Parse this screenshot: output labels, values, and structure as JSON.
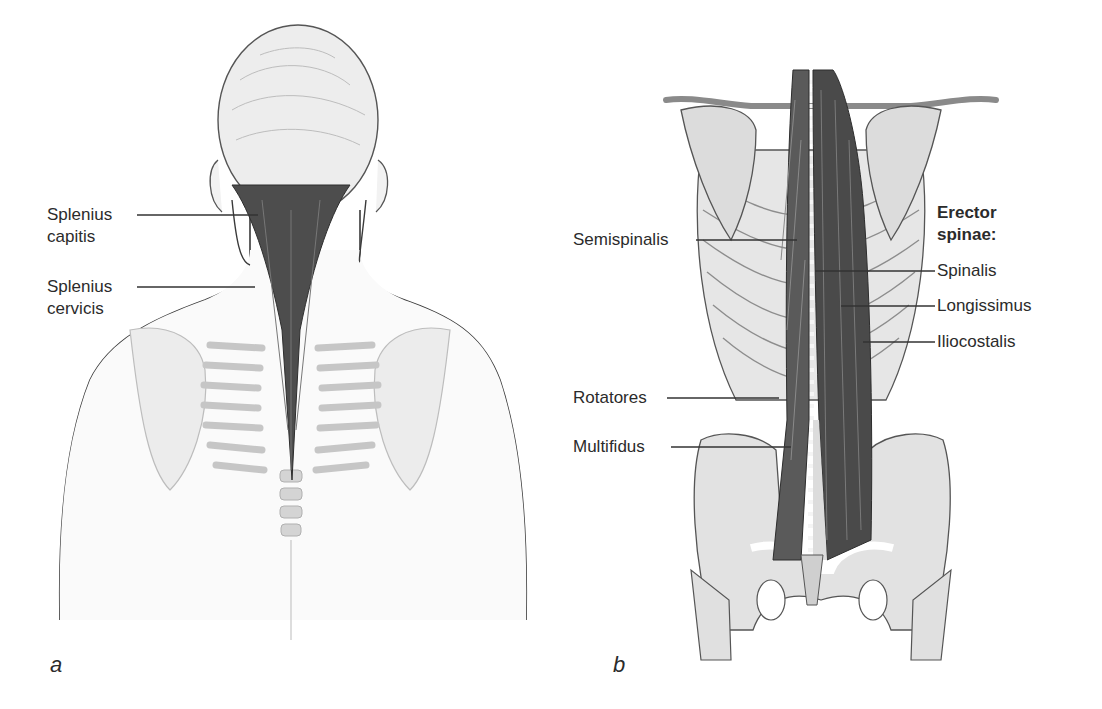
{
  "figure": {
    "panels": [
      {
        "id": "a",
        "letter": "a",
        "view": "posterior view of head, neck and upper back",
        "labels": [
          {
            "line1": "Splenius",
            "line2": "capitis"
          },
          {
            "line1": "Splenius",
            "line2": "cervicis"
          }
        ]
      },
      {
        "id": "b",
        "letter": "b",
        "view": "posterior view of deep back muscles, ribcage and pelvis",
        "labels_left": [
          "Semispinalis",
          "Rotatores",
          "Multifidus"
        ],
        "group_heading_line1": "Erector",
        "group_heading_line2": "spinae:",
        "labels_right": [
          "Spinalis",
          "Longissimus",
          "Iliocostalis"
        ]
      }
    ],
    "colors": {
      "background": "#ffffff",
      "muscle": "#4a4a4a",
      "bone": "#d9d9d9",
      "outline": "#3a3a3a",
      "leader_line": "#333333",
      "text": "#2b2b2b"
    }
  }
}
